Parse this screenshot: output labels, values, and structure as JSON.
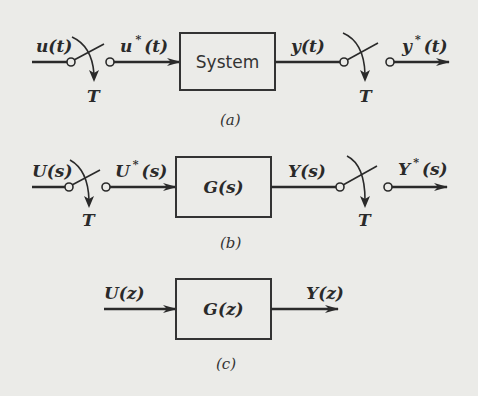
{
  "diagram": {
    "type": "block-diagram",
    "panels": [
      {
        "caption": "(a)",
        "input_label": "u(t)",
        "sampled_input_label": "u*(t)",
        "block_label": "System",
        "output_label": "y(t)",
        "sampled_output_label": "y*(t)",
        "sampler_period": "T"
      },
      {
        "caption": "(b)",
        "input_label": "U(s)",
        "sampled_input_label": "U*(s)",
        "block_label": "G(s)",
        "output_label": "Y(s)",
        "sampled_output_label": "Y*(s)",
        "sampler_period": "T"
      },
      {
        "caption": "(c)",
        "input_label": "U(z)",
        "block_label": "G(z)",
        "output_label": "Y(z)"
      }
    ]
  },
  "text": {
    "a_in": "u(t)",
    "a_in_star_base": "u",
    "a_in_star_tail": "(t)",
    "a_block": "System",
    "a_out": "y(t)",
    "a_out_star_base": "y",
    "a_out_star_tail": "(t)",
    "a_T1": "T",
    "a_T2": "T",
    "a_cap": "(a)",
    "b_in": "U(s)",
    "b_in_star_base": "U",
    "b_in_star_tail": "(s)",
    "b_block": "G(s)",
    "b_out": "Y(s)",
    "b_out_star_base": "Y",
    "b_out_star_tail": "(s)",
    "b_T1": "T",
    "b_T2": "T",
    "b_cap": "(b)",
    "c_in": "U(z)",
    "c_block": "G(z)",
    "c_out": "Y(z)",
    "c_cap": "(c)",
    "star": "*"
  }
}
